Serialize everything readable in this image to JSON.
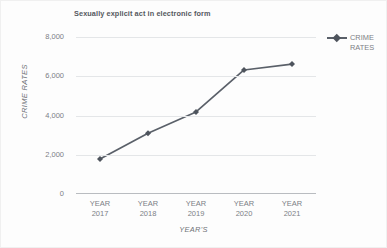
{
  "chart_data": {
    "type": "line",
    "title": "Sexually explicit act in electronic form",
    "xlabel": "YEAR'S",
    "ylabel": "CRIME RATES",
    "categories": [
      "YEAR 2017",
      "YEAR 2018",
      "YEAR 2019",
      "YEAR 2020",
      "YEAR 2021"
    ],
    "category_lines": [
      {
        "top": "YEAR",
        "bottom": "2017"
      },
      {
        "top": "YEAR",
        "bottom": "2018"
      },
      {
        "top": "YEAR",
        "bottom": "2019"
      },
      {
        "top": "YEAR",
        "bottom": "2020"
      },
      {
        "top": "YEAR",
        "bottom": "2021"
      }
    ],
    "series": [
      {
        "name": "CRIME RATES",
        "values": [
          1780,
          3100,
          4180,
          6320,
          6620
        ],
        "color": "#5a6069",
        "marker": "diamond"
      }
    ],
    "ylim": [
      0,
      8000
    ],
    "yticks": [
      0,
      2000,
      4000,
      6000,
      8000
    ],
    "ytick_labels": [
      "0",
      "2,000",
      "4,000",
      "6,000",
      "8,000"
    ],
    "grid": true,
    "grid_color": "#e4e6e8",
    "legend": {
      "position": "right",
      "entries": [
        {
          "label_line1": "CRIME",
          "label_line2": "RATES",
          "color": "#5a6069"
        }
      ]
    },
    "background": "#ffffff",
    "axis_color": "#b9bcc0",
    "text_color": "#7c8085",
    "title_color": "#55595f"
  }
}
